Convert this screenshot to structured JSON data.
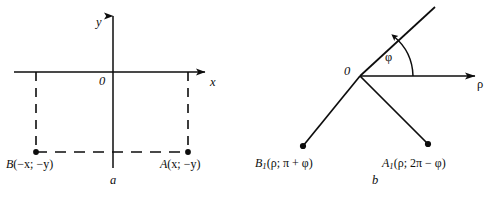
{
  "figure": {
    "caption_a": "a",
    "caption_b": "b",
    "panel_a": {
      "axis_y_label": "y",
      "axis_x_label": "x",
      "origin_label": "0",
      "point_b": {
        "name": "B",
        "coords": "(−x; −y)",
        "full": "B(−x; −y)"
      },
      "point_a": {
        "name": "A",
        "coords": "(x; −y)",
        "full": "A(x; −y)"
      }
    },
    "panel_b": {
      "origin_label": "0",
      "axis_rho_label": "ρ",
      "angle_label": "φ",
      "point_b1": {
        "name": "B",
        "sub": "1",
        "coords": "(ρ; π + φ)",
        "full": "B₁(ρ; π + φ)"
      },
      "point_a1": {
        "name": "A",
        "sub": "1",
        "coords": "(ρ; 2π − φ)",
        "full": "A₁(ρ; 2π − φ)"
      }
    },
    "colors": {
      "ink": "#0d0d0d",
      "background": "#ffffff"
    }
  }
}
